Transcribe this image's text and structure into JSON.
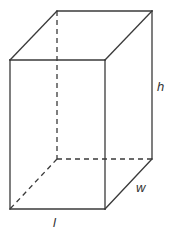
{
  "diagram": {
    "type": "rectangular-prism",
    "labels": {
      "height": "h",
      "width": "w",
      "length": "l"
    },
    "colors": {
      "line": "#3a3a3a",
      "text": "#333333",
      "background": "#ffffff"
    },
    "edges": {
      "visible": 9,
      "hidden_dashed": 3
    }
  }
}
